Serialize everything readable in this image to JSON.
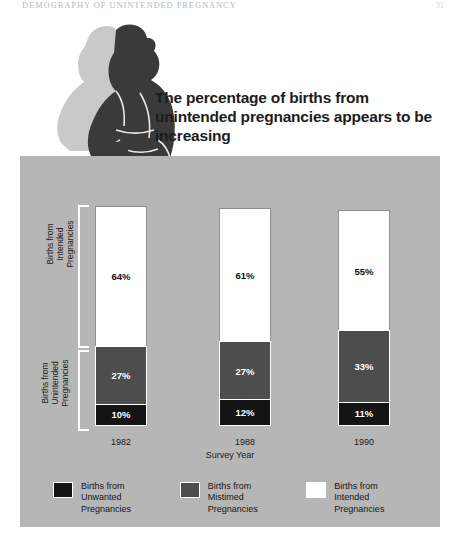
{
  "page": {
    "running_head": "DEMOGRAPHY OF UNINTENDED PREGNANCY",
    "page_number": "31"
  },
  "figure": {
    "baby_silhouette_alt": "baby-silhouette"
  },
  "chart_data": {
    "type": "bar",
    "subtype": "stacked-vertical-100percent",
    "title": "The percentage of births from unintended pregnancies appears to be increasing",
    "xlabel": "Survey Year",
    "ylabel": "",
    "categories": [
      "1982",
      "1988",
      "1990"
    ],
    "series": [
      {
        "name": "Births from Unwanted Pregnancies",
        "color": "#141414",
        "values": [
          10,
          12,
          11
        ],
        "labels": [
          "10%",
          "12%",
          "11%"
        ]
      },
      {
        "name": "Births from Mistimed Pregnancies",
        "color": "#4d4d4d",
        "values": [
          27,
          27,
          33
        ],
        "labels": [
          "27%",
          "27%",
          "33%"
        ]
      },
      {
        "name": "Births from Intended Pregnancies",
        "color": "#ffffff",
        "values": [
          64,
          61,
          55
        ],
        "labels": [
          "64%",
          "61%",
          "55%"
        ]
      }
    ],
    "ylim": [
      0,
      101
    ],
    "grid": false,
    "legend_position": "bottom",
    "axis_groups": [
      {
        "name": "intended",
        "line1": "Births from",
        "line2": "Intended",
        "line3": "Pregnancies"
      },
      {
        "name": "unintended",
        "line1": "Births from",
        "line2": "Unintended",
        "line3": "Pregnancies"
      }
    ],
    "panel_background": "#b6b6b6"
  },
  "legend": [
    {
      "swatch": "unwanted",
      "line1": "Births from",
      "line2": "Unwanted",
      "line3": "Pregnancies"
    },
    {
      "swatch": "mistimed",
      "line1": "Births from",
      "line2": "Mistimed",
      "line3": "Pregnancies"
    },
    {
      "swatch": "intended",
      "line1": "Births from",
      "line2": "Intended",
      "line3": "Pregnancies"
    }
  ]
}
